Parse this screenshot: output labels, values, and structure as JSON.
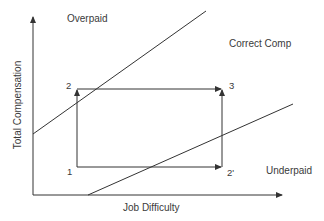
{
  "diagram": {
    "regions": {
      "overpaid": "Overpaid",
      "correct": "Correct Comp",
      "underpaid": "Underpaid"
    },
    "axes": {
      "x_label": "Job Difficulty",
      "y_label": "Total Compensation"
    },
    "points": {
      "p1": "1",
      "p2": "2",
      "p3": "3",
      "p2prime": "2'"
    },
    "colors": {
      "line": "#333333",
      "text": "#3a3a3a",
      "background": "#ffffff"
    }
  }
}
